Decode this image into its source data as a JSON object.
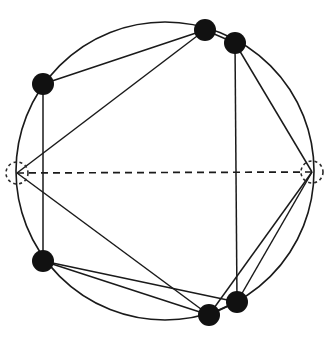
{
  "figure": {
    "caption": "",
    "background_color": "#ffffff",
    "stroke_color": "#1a1a1a",
    "node_fill_color": "#111111",
    "dashed_node_stroke_color": "#2a2a2a",
    "width": 332,
    "height": 346
  },
  "chart_data": {
    "type": "diagram",
    "subtype": "node-link-graph",
    "xlabel": "",
    "ylabel": "",
    "layout": "circular",
    "grid": false,
    "legend": "none",
    "circle": {
      "label": "layout-circle",
      "cx": 165,
      "cy": 171,
      "r": 149,
      "stroke_width": 1.6,
      "dashed": false
    },
    "nodes": [
      {
        "id": "n1",
        "label": "n1",
        "x": 205,
        "y": 30,
        "r": 11,
        "style": "filled"
      },
      {
        "id": "n2",
        "label": "n2",
        "x": 235,
        "y": 43,
        "r": 11,
        "style": "filled"
      },
      {
        "id": "n3",
        "label": "n3",
        "x": 312,
        "y": 172,
        "r": 11,
        "style": "dashed-outline"
      },
      {
        "id": "n4",
        "label": "n4",
        "x": 237,
        "y": 302,
        "r": 11,
        "style": "filled"
      },
      {
        "id": "n5",
        "label": "n5",
        "x": 209,
        "y": 315,
        "r": 11,
        "style": "filled"
      },
      {
        "id": "n6",
        "label": "n6",
        "x": 43,
        "y": 261,
        "r": 11,
        "style": "filled"
      },
      {
        "id": "n7",
        "label": "n7",
        "x": 17,
        "y": 173,
        "r": 11,
        "style": "dashed-outline"
      },
      {
        "id": "n8",
        "label": "n8",
        "x": 43,
        "y": 84,
        "r": 11,
        "style": "filled"
      }
    ],
    "edges": [
      {
        "from": "n8",
        "to": "n1",
        "style": "solid",
        "kind": "chord"
      },
      {
        "from": "n1",
        "to": "n2",
        "style": "solid",
        "kind": "chord"
      },
      {
        "from": "n1",
        "to": "n7",
        "style": "solid",
        "kind": "chord"
      },
      {
        "from": "n2",
        "to": "n4",
        "style": "solid",
        "kind": "chord"
      },
      {
        "from": "n2",
        "to": "n3",
        "style": "solid",
        "kind": "chord"
      },
      {
        "from": "n3",
        "to": "n4",
        "style": "solid",
        "kind": "chord"
      },
      {
        "from": "n3",
        "to": "n5",
        "style": "solid",
        "kind": "chord"
      },
      {
        "from": "n4",
        "to": "n5",
        "style": "solid",
        "kind": "chord"
      },
      {
        "from": "n5",
        "to": "n6",
        "style": "solid",
        "kind": "chord"
      },
      {
        "from": "n6",
        "to": "n4",
        "style": "solid",
        "kind": "chord"
      },
      {
        "from": "n6",
        "to": "n8",
        "style": "solid",
        "kind": "chord"
      },
      {
        "from": "n7",
        "to": "n5",
        "style": "solid",
        "kind": "chord"
      },
      {
        "from": "n7",
        "to": "n3",
        "style": "dashed",
        "kind": "diameter"
      }
    ],
    "arcs": [
      {
        "from": "n8",
        "to": "n1",
        "description": "circle arc over top-left"
      },
      {
        "from": "n1",
        "to": "n2",
        "description": "circle arc over top"
      },
      {
        "from": "n2",
        "to": "n3",
        "description": "circle arc down right"
      },
      {
        "from": "n3",
        "to": "n4",
        "description": "circle arc down lower-right"
      },
      {
        "from": "n4",
        "to": "n5",
        "description": "circle arc along bottom"
      },
      {
        "from": "n5",
        "to": "n6",
        "description": "circle arc along bottom-left"
      },
      {
        "from": "n6",
        "to": "n7",
        "description": "circle arc up left"
      },
      {
        "from": "n7",
        "to": "n8",
        "description": "circle arc up upper-left"
      }
    ],
    "notes": [
      "Horizontal dashed diameter connects the two dashed-outline terminal vertices.",
      "Six vertices are solid filled disks; two terminal vertices are drawn as dotted circles."
    ]
  }
}
